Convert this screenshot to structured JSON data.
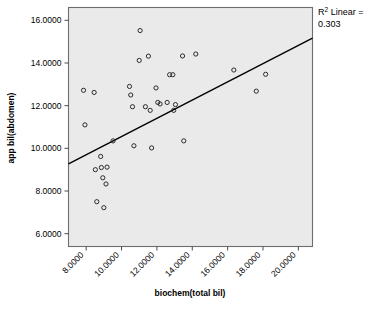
{
  "chart_data": {
    "type": "scatter",
    "title": "",
    "xlabel": "biochem(total bil)",
    "ylabel": "app bil(abdomen)",
    "xlim": [
      7.0,
      20.8
    ],
    "ylim": [
      5.4,
      16.6
    ],
    "xticks": [
      8.0,
      10.0,
      12.0,
      14.0,
      16.0,
      18.0,
      20.0
    ],
    "yticks": [
      6.0,
      8.0,
      10.0,
      12.0,
      14.0,
      16.0
    ],
    "xtick_labels": [
      "8.0000",
      "10.0000",
      "12.0000",
      "14.0000",
      "16.0000",
      "18.0000",
      "20.0000"
    ],
    "ytick_labels": [
      "6.0000",
      "8.0000",
      "10.0000",
      "12.0000",
      "14.0000",
      "16.0000"
    ],
    "grid": false,
    "legend": "none",
    "plot_bg_color": "#eaeaea",
    "marker_color": "#2b2b2b",
    "line_color": "#000000",
    "annotation_line1": "R",
    "annotation_sup": "2",
    "annotation_line1b": " Linear =",
    "annotation_line2": "0.303",
    "r_squared": 0.303,
    "fit_line": {
      "type": "linear",
      "slope": 0.2825,
      "intercept": 7.29,
      "x_start": 7.0,
      "y_start": 9.27,
      "x_end": 20.8,
      "y_end": 15.16
    },
    "points": [
      {
        "x": 7.85,
        "y": 12.72
      },
      {
        "x": 7.93,
        "y": 11.1
      },
      {
        "x": 8.45,
        "y": 12.62
      },
      {
        "x": 8.52,
        "y": 9.0
      },
      {
        "x": 8.6,
        "y": 7.5
      },
      {
        "x": 8.82,
        "y": 9.62
      },
      {
        "x": 8.86,
        "y": 9.1
      },
      {
        "x": 8.94,
        "y": 8.62
      },
      {
        "x": 9.0,
        "y": 7.22
      },
      {
        "x": 9.18,
        "y": 9.12
      },
      {
        "x": 9.12,
        "y": 8.33
      },
      {
        "x": 9.52,
        "y": 10.35
      },
      {
        "x": 10.45,
        "y": 12.9
      },
      {
        "x": 10.52,
        "y": 12.5
      },
      {
        "x": 10.62,
        "y": 11.95
      },
      {
        "x": 10.7,
        "y": 10.12
      },
      {
        "x": 11.0,
        "y": 14.12
      },
      {
        "x": 11.05,
        "y": 15.52
      },
      {
        "x": 11.35,
        "y": 11.95
      },
      {
        "x": 11.52,
        "y": 14.32
      },
      {
        "x": 11.62,
        "y": 11.78
      },
      {
        "x": 11.7,
        "y": 10.02
      },
      {
        "x": 11.95,
        "y": 12.83
      },
      {
        "x": 12.05,
        "y": 12.15
      },
      {
        "x": 12.18,
        "y": 12.08
      },
      {
        "x": 12.58,
        "y": 12.15
      },
      {
        "x": 12.72,
        "y": 13.45
      },
      {
        "x": 12.9,
        "y": 13.45
      },
      {
        "x": 12.95,
        "y": 11.78
      },
      {
        "x": 13.05,
        "y": 12.05
      },
      {
        "x": 13.45,
        "y": 14.33
      },
      {
        "x": 13.52,
        "y": 10.35
      },
      {
        "x": 14.2,
        "y": 14.42
      },
      {
        "x": 16.35,
        "y": 13.67
      },
      {
        "x": 17.62,
        "y": 12.68
      },
      {
        "x": 18.15,
        "y": 13.47
      }
    ]
  },
  "axes": {
    "x_axis_name": "biochem-total-bil-axis",
    "y_axis_name": "app-bil-abdomen-axis"
  }
}
